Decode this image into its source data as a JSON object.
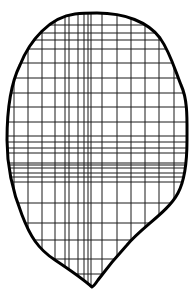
{
  "figure": {
    "outline_color": "#000000",
    "grid_color": "#1a1a1a",
    "background": "#ffffff",
    "outline_width": 3,
    "grid_width": 1,
    "outline_path": "M 97 13 C 125 13, 148 22, 160 38 C 170 52, 175 70, 181 85 C 188 100, 187 120, 187 140 C 187 160, 185 180, 178 193 C 168 212, 143 226, 127 245 C 115 258, 104 272, 98 280 C 96 283, 94 286, 92 287 C 84 280, 70 270, 55 260 C 38 249, 30 236, 22 215 C 12 190, 7 165, 7 140 C 7 110, 10 85, 20 65 C 30 40, 50 17, 75 14 C 83 13, 90 13, 97 13 Z",
    "vertical_lines_x": [
      14,
      28,
      42,
      55,
      65,
      69,
      78,
      84,
      88,
      91,
      102,
      117,
      131,
      145,
      159,
      174
    ],
    "horizontal_lines_y": [
      25,
      33,
      40,
      49,
      63,
      78,
      93,
      107,
      122,
      136,
      142,
      148,
      153,
      163,
      165,
      168,
      173,
      177,
      182,
      203,
      223,
      240,
      259,
      274
    ]
  }
}
